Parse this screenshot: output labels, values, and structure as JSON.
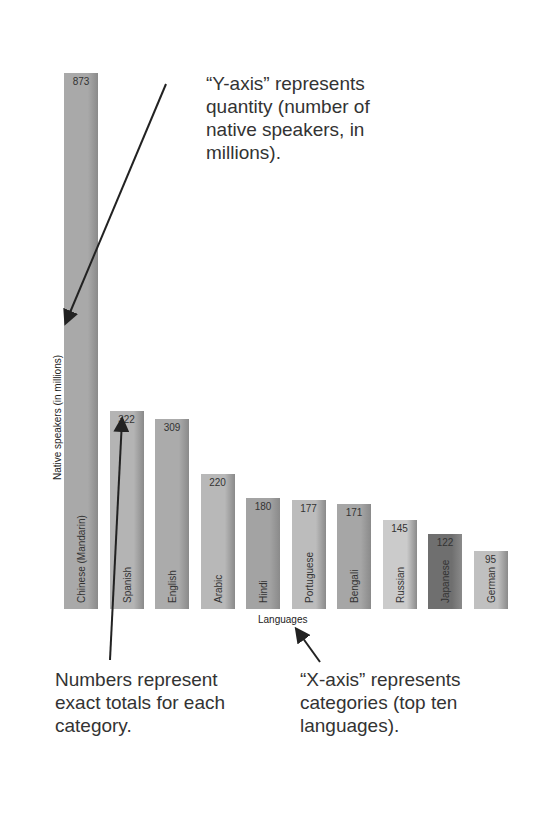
{
  "chart_data": {
    "type": "bar",
    "title": "",
    "xlabel": "Languages",
    "ylabel": "Native speakers (in millions)",
    "categories": [
      "Chinese (Mandarin)",
      "Spanish",
      "English",
      "Arabic",
      "Hindi",
      "Portuguese",
      "Bengali",
      "Russian",
      "Japanese",
      "German"
    ],
    "values": [
      873,
      322,
      309,
      220,
      180,
      177,
      171,
      145,
      122,
      95
    ],
    "colors": [
      "#a9a9a9",
      "#b4b4b4",
      "#ababab",
      "#b8b8b8",
      "#a3a3a3",
      "#bcbcbc",
      "#a6a6a6",
      "#cbcbcb",
      "#6f6f6f",
      "#c0c0c0"
    ],
    "grid": false,
    "legend": null
  },
  "annotations": {
    "y_axis": "“Y-axis” represents quantity (number of native speakers, in millions).",
    "numbers": "Numbers represent exact totals for each category.",
    "x_axis": "“X-axis” represents categories (top ten languages)."
  },
  "annotation_lines": {
    "y1": "“Y-axis” represents",
    "y2": "quantity (number of",
    "y3": "native speakers, in",
    "y4": "millions).",
    "n1": "Numbers represent",
    "n2": "exact totals for each",
    "n3": "category.",
    "x1": "“X-axis” represents",
    "x2": "categories (top ten",
    "x3": "languages)."
  }
}
